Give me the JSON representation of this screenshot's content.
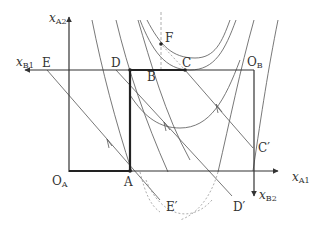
{
  "diagram": {
    "type": "edgeworth-box",
    "axes": {
      "x_a1": {
        "main": "x",
        "sub": "A1"
      },
      "x_a2": {
        "main": "x",
        "sub": "A2"
      },
      "x_b1": {
        "main": "x",
        "sub": "B1"
      },
      "x_b2": {
        "main": "x",
        "sub": "B2"
      }
    },
    "origins": {
      "o_a": {
        "main": "O",
        "sub": "A"
      },
      "o_b": {
        "main": "O",
        "sub": "B"
      }
    },
    "points": {
      "a": "A",
      "b": "B",
      "c": "C",
      "d": "D",
      "e": "E",
      "f": "F",
      "c_prime": "C′",
      "d_prime": "D′",
      "e_prime": "E′"
    },
    "colors": {
      "line": "#333333",
      "thin_line": "#555555",
      "dashed": "#999999"
    }
  }
}
